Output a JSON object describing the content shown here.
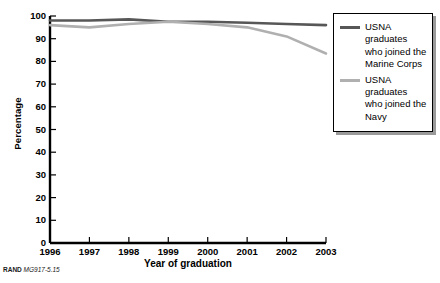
{
  "chart_data": {
    "type": "line",
    "title": "",
    "xlabel": "Year of graduation",
    "ylabel": "Percentage",
    "x": [
      1996,
      1997,
      1998,
      1999,
      2000,
      2001,
      2002,
      2003
    ],
    "xtick_labels": [
      "1996",
      "1997",
      "1998",
      "1999",
      "2000",
      "2001",
      "2002",
      "2003"
    ],
    "ytick_labels": [
      "0",
      "10",
      "20",
      "30",
      "40",
      "50",
      "60",
      "70",
      "80",
      "90",
      "100"
    ],
    "yticks": [
      0,
      10,
      20,
      30,
      40,
      50,
      60,
      70,
      80,
      90,
      100
    ],
    "ylim": [
      0,
      100
    ],
    "grid": false,
    "legend_position": "right",
    "series": [
      {
        "name": "USNA graduates who joined the Marine Corps",
        "color": "#575757",
        "values": [
          98,
          98,
          98.5,
          97.5,
          97.5,
          97,
          96.5,
          96
        ]
      },
      {
        "name": "USNA graduates who joined the Navy",
        "color": "#b0b0b0",
        "values": [
          96,
          95,
          96.5,
          97.5,
          96.5,
          95,
          91,
          83.5
        ]
      }
    ]
  },
  "legend": {
    "items": [
      {
        "label": "USNA graduates who joined the Marine Corps",
        "color": "#575757"
      },
      {
        "label": "USNA graduates who joined the Navy",
        "color": "#b0b0b0"
      }
    ]
  },
  "source_note": {
    "rand_tag": "RAND",
    "doc_id": "MG917-5.15"
  }
}
